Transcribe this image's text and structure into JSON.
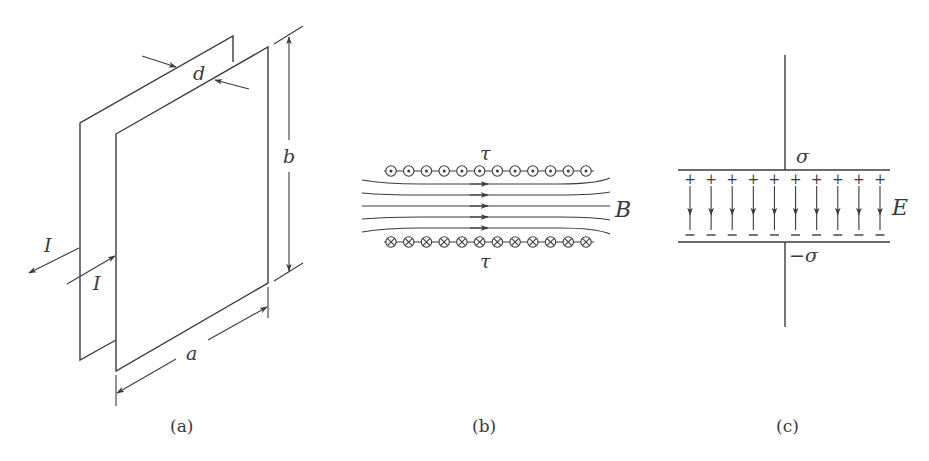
{
  "figure": {
    "panels": [
      {
        "id": "a",
        "caption": "(a)",
        "description": "Two parallel rectangular conducting plates separated by distance d, width a, height b, carrying current I in opposite directions",
        "labels": {
          "gap": "d",
          "height": "b",
          "width": "a",
          "current_out": "I",
          "current_in": "I"
        }
      },
      {
        "id": "b",
        "caption": "(b)",
        "description": "Cross-section: upper row of currents out of page, lower row into page, uniform magnetic field B between them",
        "labels": {
          "top_density": "τ",
          "bottom_density": "τ",
          "field": "B"
        },
        "top_row_count": 12,
        "bottom_row_count": 12,
        "field_line_count": 5
      },
      {
        "id": "c",
        "caption": "(c)",
        "description": "Parallel plate capacitor with surface charge +σ on top, −σ on bottom, uniform field E pointing down",
        "labels": {
          "top_charge": "σ",
          "bottom_charge": "−σ",
          "field": "E",
          "plus": "+",
          "minus": "−"
        },
        "arrow_count": 10
      }
    ]
  }
}
